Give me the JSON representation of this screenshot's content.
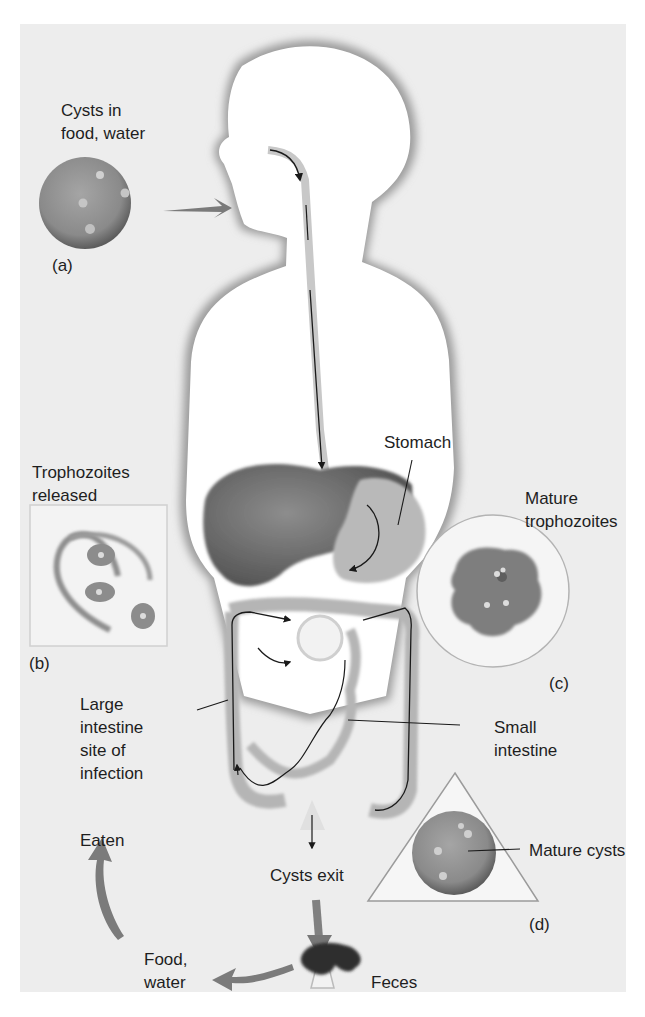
{
  "diagram": {
    "colors": {
      "background": "#ededed",
      "body_fill": "#ffffff",
      "body_shadow": "#9a9a9a",
      "organ_dark": "#6f6f6f",
      "organ_mid": "#a8a8a8",
      "cyst_fill": "#8d8d8d",
      "arrow_gray": "#7a7a7a",
      "path_line": "#1a1a1a",
      "text": "#1e1e1e"
    },
    "labels": {
      "cysts_in_food": "Cysts in\nfood, water",
      "panel_a": "(a)",
      "trophozoites_released": "Trophozoites\nreleased",
      "panel_b": "(b)",
      "stomach": "Stomach",
      "mature_trophozoites": "Mature\ntrophozoites",
      "panel_c": "(c)",
      "large_intestine": "Large\nintestine\nsite of\ninfection",
      "small_intestine": "Small\nintestine",
      "eaten": "Eaten",
      "cysts_exit": "Cysts exit",
      "mature_cysts": "Mature cysts",
      "panel_d": "(d)",
      "food_water": "Food,\nwater",
      "feces": "Feces"
    },
    "stages": [
      {
        "id": "a",
        "name": "Cysts in food, water",
        "shape": "circle"
      },
      {
        "id": "b",
        "name": "Trophozoites released",
        "shape": "square"
      },
      {
        "id": "c",
        "name": "Mature trophozoites",
        "shape": "circle"
      },
      {
        "id": "d",
        "name": "Mature cysts",
        "shape": "triangle"
      }
    ],
    "flow": [
      "Cysts in food, water",
      "Stomach",
      "Trophozoites released",
      "Large intestine site of infection",
      "Mature trophozoites",
      "Small intestine",
      "Cysts exit",
      "Feces",
      "Food, water",
      "Eaten"
    ]
  }
}
